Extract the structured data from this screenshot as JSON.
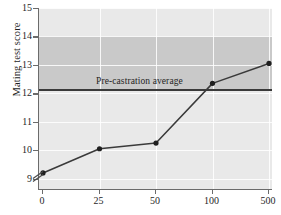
{
  "chart_data": {
    "type": "line",
    "title": "",
    "xlabel": "",
    "ylabel": "Mating test score",
    "categories": [
      "0",
      "25",
      "50",
      "100",
      "500"
    ],
    "values": [
      9.2,
      10.05,
      10.25,
      12.35,
      13.05
    ],
    "series": [
      {
        "name": "Mating test score",
        "values": [
          9.2,
          10.05,
          10.25,
          12.35,
          13.05
        ]
      }
    ],
    "ylim": [
      8.6,
      15
    ],
    "y_ticks": [
      9,
      10,
      11,
      12,
      13,
      14,
      15
    ],
    "x_ticks": [
      "0",
      "25",
      "50",
      "100",
      "500"
    ],
    "grid": true,
    "legend": "none",
    "y_axis_break": true,
    "annotations": [
      {
        "name": "reference-line",
        "label": "Pre-castration average",
        "value": 12.15,
        "orientation": "horizontal"
      },
      {
        "name": "reference-band",
        "label": "Pre-castration range",
        "y_min": 12.15,
        "y_max": 14.0
      }
    ],
    "colors": {
      "plot_background": "#e9e9e9",
      "band": "#c9c9c9",
      "gridline": "#ffffff",
      "series_line": "#3a3a3a",
      "marker": "#1f1f1f",
      "reference_line": "#3a3a3a",
      "axis": "#6b6b6b",
      "text": "#1f1f1f"
    }
  },
  "axes": {
    "y_title": "Mating test score",
    "y_tick_labels": [
      "15",
      "14",
      "13",
      "12",
      "11",
      "10",
      "9"
    ],
    "x_tick_labels": [
      "0",
      "25",
      "50",
      "100",
      "500"
    ]
  },
  "annotations": {
    "reference_label": "Pre-castration average"
  }
}
